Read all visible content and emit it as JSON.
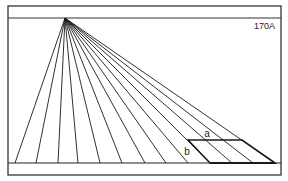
{
  "figure": {
    "id_label": "170A",
    "labels": {
      "a": "a",
      "b": "b"
    },
    "colors": {
      "ink": "#1a1a1a",
      "frame": "#333333",
      "background": "#ffffff"
    },
    "frame": {
      "x": 8,
      "y": 6,
      "width": 273,
      "height": 169
    },
    "horizon_y": 18,
    "ground_y": 163,
    "vanishing_point": {
      "x": 65,
      "y": 18
    },
    "fan_bases_x": [
      15,
      36,
      58,
      78,
      100,
      122,
      145,
      166,
      188,
      210,
      232,
      253,
      275
    ],
    "grid_rect": {
      "top_y": 140,
      "top_x1": 188,
      "top_x2": 242,
      "bottom_x1": 210,
      "bottom_x2": 275
    }
  }
}
